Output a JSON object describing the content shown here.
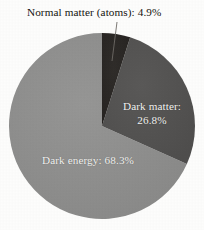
{
  "figure": {
    "background_color": "#fdfdfc",
    "text_color": "#15130f"
  },
  "chart_data": {
    "type": "pie",
    "title": "",
    "xlabel": "",
    "ylabel": "",
    "legend_position": "none",
    "grid": false,
    "start_angle_deg": 0,
    "direction": "clockwise",
    "categories": [
      "Normal matter (atoms)",
      "Dark matter",
      "Dark energy"
    ],
    "values": [
      4.9,
      26.8,
      68.3
    ],
    "value_unit": "%",
    "colors": [
      "#2b2826",
      "#545352",
      "#8e8e8d"
    ],
    "slices": [
      {
        "name": "Normal matter (atoms)",
        "value": 4.9,
        "label": "Normal matter (atoms): 4.9%",
        "color": "#2b2826",
        "label_placement": "outside-callout",
        "start_deg": 0,
        "end_deg": 17.64
      },
      {
        "name": "Dark matter",
        "value": 26.8,
        "label_line1": "Dark matter:",
        "label_line2": "26.8%",
        "color": "#545352",
        "label_placement": "inside",
        "label_color": "#f4f4f2",
        "start_deg": 17.64,
        "end_deg": 114.12
      },
      {
        "name": "Dark energy",
        "value": 68.3,
        "label_line1": "Dark energy: 68.3%",
        "color": "#8e8e8d",
        "label_placement": "inside",
        "label_color": "#f4f4f2",
        "start_deg": 114.12,
        "end_deg": 360
      }
    ]
  },
  "annotations": {
    "atoms_caption": "Normal matter (atoms): 4.9%",
    "dark_matter_line1": "Dark matter:",
    "dark_matter_line2": "26.8%",
    "dark_energy_line1": "Dark energy: 68.3%"
  },
  "geometry": {
    "center_x": 102,
    "center_y": 126,
    "radius": 93
  }
}
